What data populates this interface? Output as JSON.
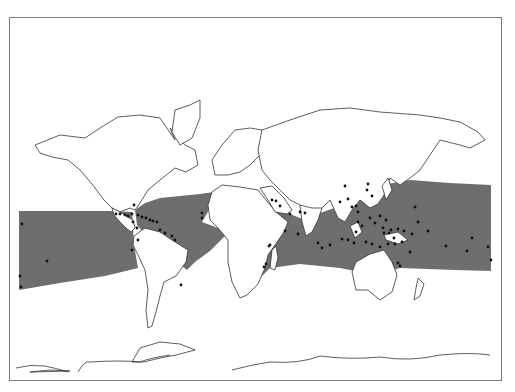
{
  "map": {
    "title": "",
    "colors": {
      "zone": "#6e6e6e",
      "land_fill": "#ffffff",
      "coast": "#333333",
      "dot": "#111111",
      "frame": "#7a7a7a"
    },
    "zone_bands": [
      {
        "name": "tropical-zone-pacific-east",
        "points": "19,211 112,211 132,212 134,245 138,268 105,276 60,283 19,290"
      },
      {
        "name": "tropical-zone-atlantic",
        "points": "135,210 145,203 160,198 200,194 214,192 209,210 202,222 218,228 228,233 210,251 195,262 187,270 150,240 137,225"
      },
      {
        "name": "tropical-zone-indian-pacific",
        "points": "254,190 262,200 272,205 290,214 305,220 320,213 340,206 352,195 355,186 363,182 370,184 376,186 410,180 450,183 491,185 491,271 455,270 400,268 375,275 340,268 300,264 270,268 260,278 262,240 268,220 256,207"
      }
    ],
    "landmasses": [
      {
        "name": "north-america",
        "points": "35,145 60,135 85,138 100,128 118,117 140,115 160,118 175,140 170,128 185,145 195,150 198,165 186,172 175,168 160,180 148,190 140,203 135,210 130,208 120,212 112,208 104,200 92,184 80,170 68,160 52,157 40,153"
      },
      {
        "name": "central-america",
        "points": "112,208 120,212 126,216 133,220 135,228 131,232 126,228 120,222 114,215"
      },
      {
        "name": "greenland",
        "points": "175,110 190,105 200,100 200,118 192,138 180,145 172,132"
      },
      {
        "name": "south-america",
        "points": "134,236 145,228 160,232 172,240 188,250 186,262 176,276 164,282 160,296 156,312 152,326 148,328 146,310 148,290 145,270 138,255 133,245"
      },
      {
        "name": "europe",
        "points": "215,175 212,160 222,145 235,130 250,128 262,130 270,145 260,155 250,165 240,172 228,175"
      },
      {
        "name": "africa",
        "points": "212,192 222,185 240,187 258,190 266,200 276,212 288,222 284,232 275,245 268,255 265,268 258,284 247,295 240,298 232,282 228,262 228,240 218,228 210,220 208,205"
      },
      {
        "name": "arabia",
        "points": "260,188 272,186 284,198 292,210 287,214 275,212 268,200"
      },
      {
        "name": "asia",
        "points": "262,130 290,120 320,110 350,108 380,112 420,115 440,118 460,122 478,132 485,140 470,148 460,145 440,140 430,155 420,170 410,178 400,185 390,178 384,195 378,204 370,208 360,200 352,210 345,222 338,218 330,200 320,210 310,215 300,205 290,200 280,190 270,180 262,170 258,150"
      },
      {
        "name": "india",
        "points": "300,205 312,208 322,208 318,220 312,232 306,236 302,222"
      },
      {
        "name": "madagascar",
        "points": "272,250 276,246 278,258 275,270 270,268"
      },
      {
        "name": "australia",
        "points": "356,262 370,254 384,250 392,262 397,275 392,292 380,300 368,290 356,290 352,272"
      },
      {
        "name": "new-zealand",
        "points": "418,278 424,284 420,296 414,300 416,288"
      },
      {
        "name": "japan",
        "points": "382,186 388,178 392,190 386,200"
      },
      {
        "name": "borneo",
        "points": "350,226 358,222 362,232 355,238"
      },
      {
        "name": "new-guinea",
        "points": "384,235 398,232 408,240 398,244 386,240"
      },
      {
        "name": "antarctica-west",
        "points": "30,372 50,370 70,371"
      },
      {
        "name": "antarctic-peninsula",
        "points": "132,362 140,348 160,342 180,344 195,350 176,355 160,358 144,362"
      }
    ],
    "coast_lines": [
      {
        "name": "antarctica-coast-left",
        "d": "M 16 368 Q 30 364 45 366 Q 55 368 68 372"
      },
      {
        "name": "antarctica-coast-mid",
        "d": "M 78 372 Q 85 360 90 362 Q 120 360 140 362 Q 150 358 170 355"
      },
      {
        "name": "antarctica-coast-right",
        "d": "M 232 370 Q 250 365 270 362 Q 300 364 320 356 Q 350 360 380 357 Q 410 362 440 355 Q 470 352 490 355"
      }
    ],
    "dots": [
      [
        22,
        224
      ],
      [
        20,
        276
      ],
      [
        21,
        287
      ],
      [
        47,
        261
      ],
      [
        116,
        214
      ],
      [
        120,
        214
      ],
      [
        125,
        215
      ],
      [
        128,
        216
      ],
      [
        132,
        214
      ],
      [
        138,
        215
      ],
      [
        142,
        217
      ],
      [
        146,
        218
      ],
      [
        150,
        220
      ],
      [
        153,
        221
      ],
      [
        157,
        222
      ],
      [
        133,
        222
      ],
      [
        137,
        228
      ],
      [
        160,
        230
      ],
      [
        165,
        233
      ],
      [
        172,
        236
      ],
      [
        175,
        240
      ],
      [
        134,
        205
      ],
      [
        132,
        250
      ],
      [
        202,
        213
      ],
      [
        202,
        218
      ],
      [
        181,
        285
      ],
      [
        138,
        240
      ],
      [
        272,
        200
      ],
      [
        276,
        201
      ],
      [
        280,
        206
      ],
      [
        290,
        214
      ],
      [
        300,
        212
      ],
      [
        305,
        213
      ],
      [
        285,
        231
      ],
      [
        298,
        234
      ],
      [
        270,
        245
      ],
      [
        266,
        264
      ],
      [
        264,
        267
      ],
      [
        269,
        246
      ],
      [
        340,
        202
      ],
      [
        348,
        199
      ],
      [
        352,
        207
      ],
      [
        356,
        206
      ],
      [
        358,
        212
      ],
      [
        358,
        222
      ],
      [
        362,
        226
      ],
      [
        370,
        218
      ],
      [
        375,
        223
      ],
      [
        380,
        216
      ],
      [
        383,
        228
      ],
      [
        384,
        233
      ],
      [
        389,
        233
      ],
      [
        391,
        230
      ],
      [
        394,
        238
      ],
      [
        398,
        229
      ],
      [
        404,
        231
      ],
      [
        402,
        242
      ],
      [
        395,
        244
      ],
      [
        388,
        244
      ],
      [
        380,
        247
      ],
      [
        372,
        244
      ],
      [
        366,
        242
      ],
      [
        356,
        232
      ],
      [
        354,
        243
      ],
      [
        348,
        240
      ],
      [
        342,
        239
      ],
      [
        330,
        245
      ],
      [
        322,
        248
      ],
      [
        318,
        243
      ],
      [
        412,
        234
      ],
      [
        418,
        222
      ],
      [
        428,
        231
      ],
      [
        446,
        246
      ],
      [
        467,
        251
      ],
      [
        472,
        238
      ],
      [
        488,
        247
      ],
      [
        491,
        260
      ],
      [
        410,
        252
      ],
      [
        398,
        263
      ],
      [
        400,
        266
      ],
      [
        386,
        220
      ],
      [
        372,
        196
      ],
      [
        367,
        190
      ],
      [
        368,
        184
      ],
      [
        415,
        207
      ],
      [
        345,
        186
      ]
    ]
  }
}
